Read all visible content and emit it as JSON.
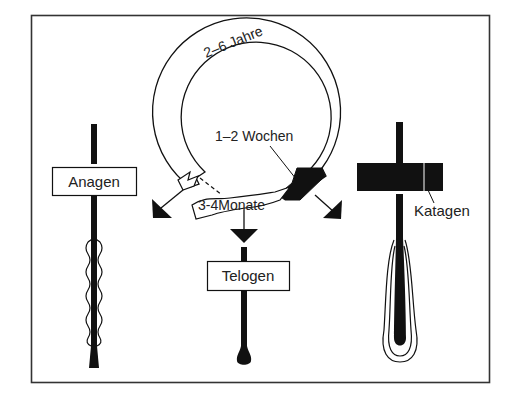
{
  "diagram": {
    "type": "hair-growth-cycle",
    "colors": {
      "ink": "#111111",
      "paper": "#ffffff",
      "frame": "#333333"
    },
    "cycle_ring": {
      "duration_anagen": "2–6 Jahre",
      "duration_katagen": "1–2 Wochen",
      "duration_telogen": "3-4Monate"
    },
    "phases": [
      {
        "id": "anagen",
        "label": "Anagen"
      },
      {
        "id": "katagen",
        "label": "Katagen"
      },
      {
        "id": "telogen",
        "label": "Telogen"
      }
    ]
  }
}
